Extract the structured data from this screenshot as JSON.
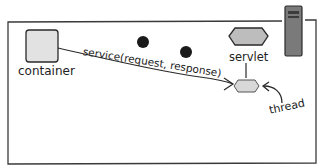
{
  "diagram": {
    "container_label": "container",
    "call_label": "service(request, response)",
    "servlet_label": "servlet",
    "thread_label": "thread"
  },
  "colors": {
    "frame": "#3a3a3a",
    "shape_fill": "#c8c8c8",
    "container_fill": "#e2e2e2",
    "dot": "#1a1a1a",
    "server": "#6e6e6e"
  }
}
